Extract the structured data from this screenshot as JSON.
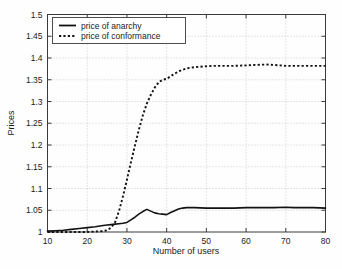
{
  "chart_data": {
    "type": "line",
    "title": "",
    "subtitle": "",
    "xlabel": "Number of users",
    "ylabel": "Prices",
    "xlim": [
      10,
      80
    ],
    "ylim": [
      1,
      1.5
    ],
    "xticks": [
      10,
      20,
      30,
      40,
      50,
      60,
      70,
      80
    ],
    "yticks": [
      1,
      1.05,
      1.1,
      1.15,
      1.2,
      1.25,
      1.3,
      1.35,
      1.4,
      1.45,
      1.5
    ],
    "xtick_labels": [
      "10",
      "20",
      "30",
      "40",
      "50",
      "60",
      "70",
      "80"
    ],
    "ytick_labels": [
      "1",
      "1.05",
      "1.1",
      "1.15",
      "1.2",
      "1.25",
      "1.3",
      "1.35",
      "1.4",
      "1.45",
      "1.5"
    ],
    "grid": true,
    "grid_style": "dotted",
    "legend_position": "upper left",
    "x": [
      10,
      12,
      14,
      16,
      18,
      20,
      22,
      24,
      25,
      26,
      27,
      28,
      29,
      30,
      31,
      32,
      33,
      34,
      35,
      36,
      37,
      38,
      39,
      40,
      41,
      42,
      43,
      44,
      45,
      47,
      50,
      52,
      55,
      57,
      60,
      62,
      65,
      67,
      70,
      72,
      75,
      77,
      80
    ],
    "series": [
      {
        "name": "price of anarchy",
        "style": "solid",
        "color": "#121212",
        "values": [
          1.002,
          1.003,
          1.004,
          1.006,
          1.008,
          1.01,
          1.012,
          1.015,
          1.016,
          1.017,
          1.018,
          1.019,
          1.02,
          1.022,
          1.028,
          1.034,
          1.041,
          1.047,
          1.052,
          1.048,
          1.044,
          1.042,
          1.041,
          1.04,
          1.045,
          1.049,
          1.053,
          1.055,
          1.056,
          1.056,
          1.055,
          1.055,
          1.055,
          1.055,
          1.056,
          1.056,
          1.056,
          1.056,
          1.057,
          1.056,
          1.056,
          1.056,
          1.055
        ]
      },
      {
        "name": "price of conformance",
        "style": "dotted",
        "color": "#121212",
        "values": [
          1.0,
          1.0,
          1.0,
          1.0,
          1.0,
          1.0,
          1.001,
          1.002,
          1.004,
          1.01,
          1.022,
          1.048,
          1.082,
          1.12,
          1.16,
          1.198,
          1.235,
          1.268,
          1.295,
          1.315,
          1.332,
          1.344,
          1.35,
          1.352,
          1.358,
          1.364,
          1.369,
          1.373,
          1.376,
          1.379,
          1.381,
          1.382,
          1.382,
          1.382,
          1.383,
          1.384,
          1.385,
          1.384,
          1.382,
          1.382,
          1.382,
          1.382,
          1.382
        ]
      }
    ]
  },
  "legend": {
    "entries": [
      {
        "label": "price of anarchy",
        "style": "solid"
      },
      {
        "label": "price of conformance",
        "style": "dotted"
      }
    ]
  },
  "axes": {
    "x_title": "Number of users",
    "y_title": "Prices"
  }
}
